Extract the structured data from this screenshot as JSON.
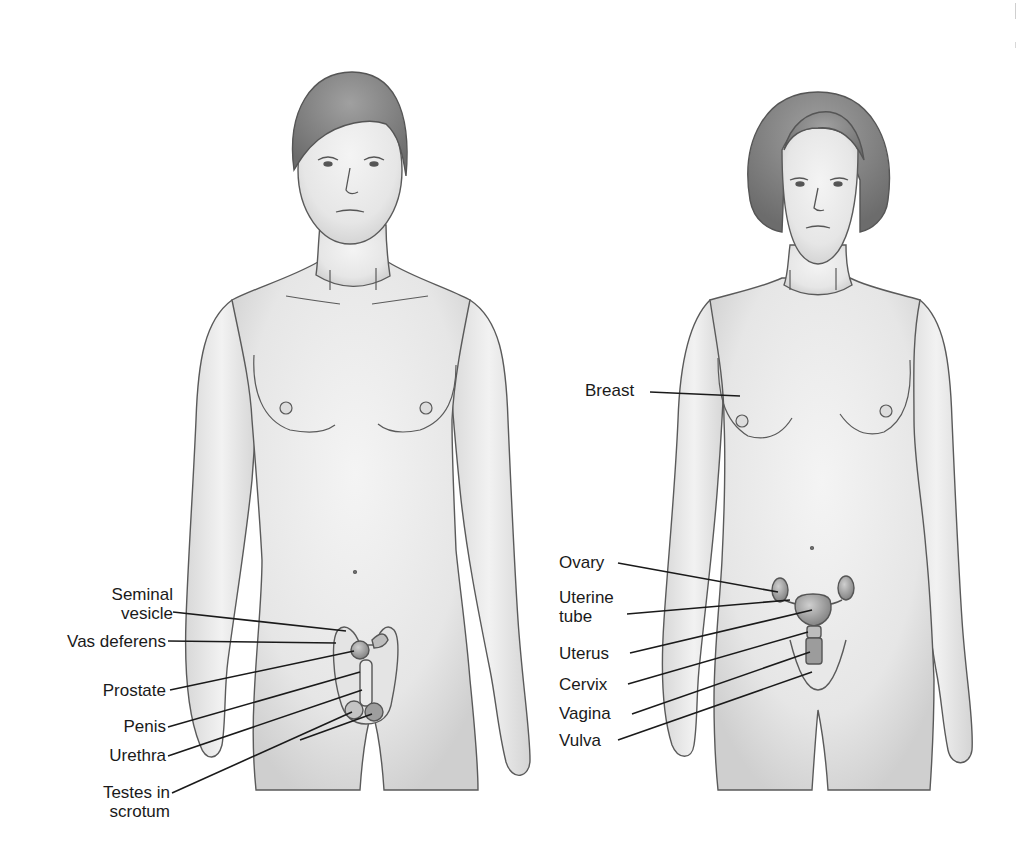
{
  "diagram": {
    "type": "anatomical-illustration",
    "figures": [
      {
        "id": "male",
        "position": "left",
        "labels": [
          {
            "text_lines": [
              "Seminal",
              "vesicle"
            ],
            "target": "seminal vesicle"
          },
          {
            "text_lines": [
              "Vas deferens"
            ],
            "target": "vas deferens"
          },
          {
            "text_lines": [
              "Prostate"
            ],
            "target": "prostate gland"
          },
          {
            "text_lines": [
              "Penis"
            ],
            "target": "penis"
          },
          {
            "text_lines": [
              "Urethra"
            ],
            "target": "urethra"
          },
          {
            "text_lines": [
              "Testes in",
              "scrotum"
            ],
            "target": "testes"
          }
        ]
      },
      {
        "id": "female",
        "position": "right",
        "labels": [
          {
            "text_lines": [
              "Breast"
            ],
            "target": "breast"
          },
          {
            "text_lines": [
              "Ovary"
            ],
            "target": "ovary"
          },
          {
            "text_lines": [
              "Uterine",
              "tube"
            ],
            "target": "uterine tube"
          },
          {
            "text_lines": [
              "Uterus"
            ],
            "target": "uterus"
          },
          {
            "text_lines": [
              "Cervix"
            ],
            "target": "cervix"
          },
          {
            "text_lines": [
              "Vagina"
            ],
            "target": "vagina"
          },
          {
            "text_lines": [
              "Vulva"
            ],
            "target": "vulva"
          }
        ]
      }
    ]
  },
  "labels": {
    "male": {
      "seminal_1": "Seminal",
      "seminal_2": "vesicle",
      "vas": "Vas deferens",
      "prostate": "Prostate",
      "penis": "Penis",
      "urethra": "Urethra",
      "testes_1": "Testes in",
      "testes_2": "scrotum"
    },
    "female": {
      "breast": "Breast",
      "ovary": "Ovary",
      "tube_1": "Uterine",
      "tube_2": "tube",
      "uterus": "Uterus",
      "cervix": "Cervix",
      "vagina": "Vagina",
      "vulva": "Vulva"
    }
  },
  "colors": {
    "background": "#ffffff",
    "skin": "#ececec",
    "skin_shade": "#d6d6d6",
    "outline": "#5a5a5a",
    "hair": "#8a8a8a",
    "leader_line": "#1a1a1a",
    "organ": "#a8a8a8"
  }
}
